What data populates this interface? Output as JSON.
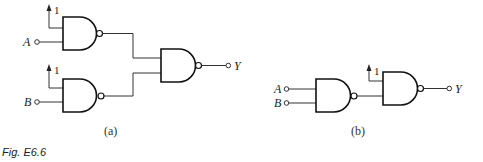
{
  "figure": {
    "caption": "Fig. E6.6",
    "panels": [
      {
        "label": "(a)",
        "inputs": [
          {
            "name": "A"
          },
          {
            "name": "B"
          }
        ],
        "constants": [
          "1",
          "1"
        ],
        "output": "Y",
        "gates": [
          "NAND",
          "NAND",
          "NAND"
        ]
      },
      {
        "label": "(b)",
        "inputs": [
          {
            "name": "A"
          },
          {
            "name": "B"
          }
        ],
        "constants": [
          "1"
        ],
        "output": "Y",
        "gates": [
          "NAND",
          "NAND"
        ]
      }
    ]
  }
}
